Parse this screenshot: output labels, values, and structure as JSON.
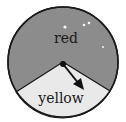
{
  "spinner": {
    "sections": [
      {
        "label": "red",
        "color": "#8c8c8c"
      },
      {
        "label": "yellow",
        "color": "#e9e9e9"
      }
    ],
    "outline_color": "#1a1a1a",
    "pointer_color": "#111111"
  }
}
